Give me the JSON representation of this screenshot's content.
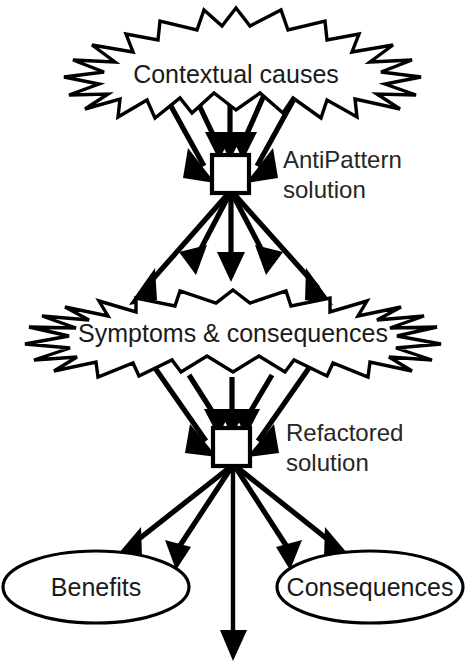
{
  "diagram": {
    "type": "flow-diagram",
    "background_color": "#ffffff",
    "line_color": "#000000",
    "fill_color": "#ffffff",
    "nodes": {
      "contextual_causes": {
        "label": "Contextual causes",
        "shape": "starburst"
      },
      "antipattern_solution": {
        "label_line1": "AntiPattern",
        "label_line2": "solution",
        "shape": "square"
      },
      "symptoms_consequences": {
        "label": "Symptoms & consequences",
        "shape": "starburst"
      },
      "refactored_solution": {
        "label_line1": "Refactored",
        "label_line2": "solution",
        "shape": "square"
      },
      "benefits": {
        "label": "Benefits",
        "shape": "ellipse"
      },
      "consequences": {
        "label": "Consequences",
        "shape": "ellipse"
      }
    },
    "edges": [
      {
        "from": "contextual_causes",
        "to": "antipattern_solution",
        "count": 5
      },
      {
        "from": "antipattern_solution",
        "to": "symptoms_consequences",
        "count": 5
      },
      {
        "from": "symptoms_consequences",
        "to": "refactored_solution",
        "count": 5
      },
      {
        "from": "refactored_solution",
        "to": "benefits",
        "count": 2
      },
      {
        "from": "refactored_solution",
        "to": "consequences",
        "count": 2
      },
      {
        "from": "refactored_solution",
        "to": "below",
        "count": 1
      }
    ],
    "caption": ""
  }
}
